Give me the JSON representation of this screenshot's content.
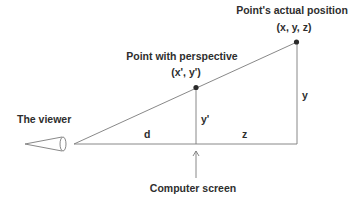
{
  "diagram": {
    "title_actual": "Point's actual position",
    "coords_actual": "(x, y, z)",
    "title_perspective": "Point with perspective",
    "coords_perspective": "(x', y')",
    "viewer_label": "The viewer",
    "screen_label": "Computer screen",
    "segment_d": "d",
    "segment_z": "z",
    "height_y": "y",
    "height_y_prime": "y'"
  },
  "colors": {
    "line": "#7a7a7a",
    "point": "#2b2b2b",
    "text": "#2e2e2e",
    "background": "#ffffff"
  }
}
